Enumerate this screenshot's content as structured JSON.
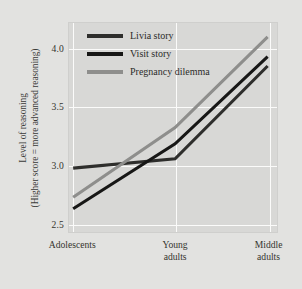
{
  "chart_data": {
    "type": "line",
    "title": "",
    "xlabel": "",
    "ylabel_line1": "Level of reasoning",
    "ylabel_line2": "(Higher score = more advanced reasoning)",
    "categories": [
      "Adolescents",
      "Young\nadults",
      "Middle\nadults"
    ],
    "category_labels_flat": [
      "Adolescents",
      "Young adults",
      "Middle adults"
    ],
    "yticks": [
      "2.5",
      "3.0",
      "3.5",
      "4.0"
    ],
    "ytick_values": [
      2.5,
      3.0,
      3.5,
      4.0
    ],
    "ylim": [
      2.42,
      4.22
    ],
    "grid": true,
    "legend_position": "top-left-inside",
    "series": [
      {
        "name": "Livia story",
        "color": "#2e2e2c",
        "values": [
          2.97,
          3.05,
          3.85
        ]
      },
      {
        "name": "Visit story",
        "color": "#171716",
        "values": [
          2.62,
          3.18,
          3.93
        ]
      },
      {
        "name": "Pregnancy dilemma",
        "color": "#8e8e8c",
        "values": [
          2.72,
          3.32,
          4.1
        ]
      }
    ]
  },
  "style": {
    "figure_background": "#e2e2e0",
    "plot_background": "#d8d8d6",
    "gridline_color": "#fbfbfa",
    "text_color": "#35352f"
  }
}
